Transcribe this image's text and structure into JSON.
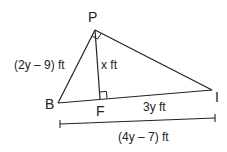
{
  "diagram": {
    "type": "right-triangle-altitude",
    "vertices": {
      "P": {
        "label": "P",
        "x": 95,
        "y": 30
      },
      "B": {
        "label": "B",
        "x": 58,
        "y": 103
      },
      "F": {
        "label": "F",
        "x": 100,
        "y": 99
      },
      "I": {
        "label": "I",
        "x": 212,
        "y": 90
      }
    },
    "labels": {
      "side_pb": "(2y – 9) ft",
      "altitude_pf": "x ft",
      "segment_fi": "3y ft",
      "segment_bi": "(4y – 7) ft"
    },
    "right_angles": [
      "P",
      "F"
    ],
    "stroke_color": "#222222"
  }
}
